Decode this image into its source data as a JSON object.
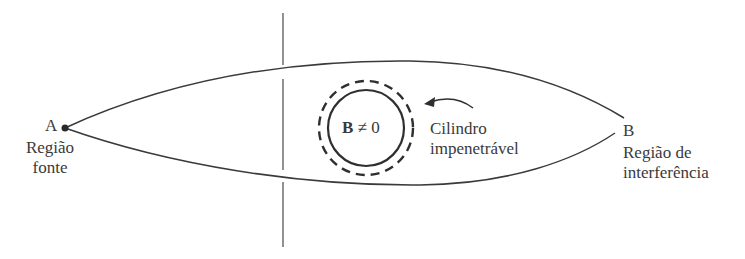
{
  "diagram": {
    "point_a": {
      "label": "A",
      "region": "Região",
      "region_line2": "fonte"
    },
    "point_b": {
      "label": "B",
      "region": "Região de",
      "region_line2": "interferência"
    },
    "cylinder": {
      "field_symbol": "B",
      "field_relation": "≠ 0",
      "annotation_line1": "Cilindro",
      "annotation_line2": "impenetrável"
    },
    "colors": {
      "stroke": "#3a3a3a",
      "text": "#3a3a3a",
      "background": "#ffffff"
    }
  }
}
